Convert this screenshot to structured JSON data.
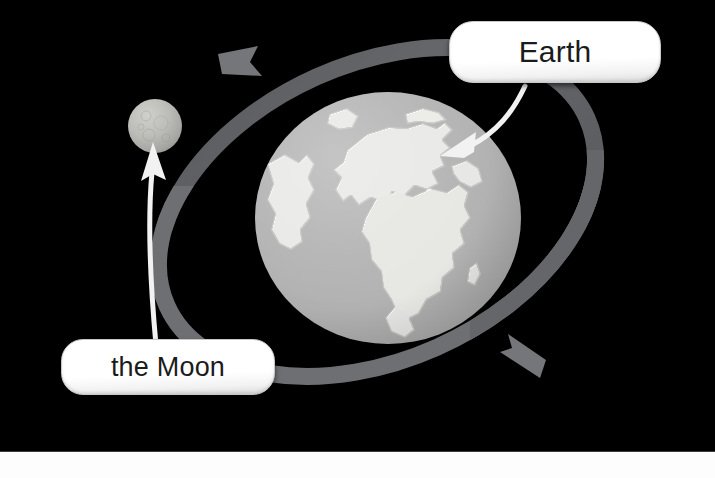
{
  "scene": {
    "title": "Earth and Moon orbit diagram",
    "background_color": "#000000",
    "bottom_strip_color": "#fdfdfd"
  },
  "bodies": [
    {
      "id": "earth",
      "name": "Earth",
      "icon": "earth-globe-icon",
      "color": "#b0b0b0",
      "center": {
        "x": 388,
        "y": 218
      },
      "radius_px": 133
    },
    {
      "id": "moon",
      "name": "the Moon",
      "icon": "moon-sphere-icon",
      "color": "#bdbdba",
      "center": {
        "x": 155,
        "y": 126
      },
      "radius_px": 27
    }
  ],
  "orbit": {
    "name": "moon-orbit-ring",
    "color": "#5f6164",
    "color_over_earth": "#6e7073",
    "direction": "counterclockwise",
    "arrows": [
      {
        "id": "orbit-arrow-top",
        "points": "left"
      },
      {
        "id": "orbit-arrow-bottom",
        "points": "right"
      }
    ]
  },
  "callouts": [
    {
      "id": "callout-earth",
      "label": "Earth",
      "target": "earth",
      "leader_color": "#ffffff",
      "leader_arrow": "arrow-down-left-icon"
    },
    {
      "id": "callout-moon",
      "label": "the Moon",
      "target": "moon",
      "leader_color": "#ffffff",
      "leader_arrow": "arrow-up-icon"
    }
  ]
}
